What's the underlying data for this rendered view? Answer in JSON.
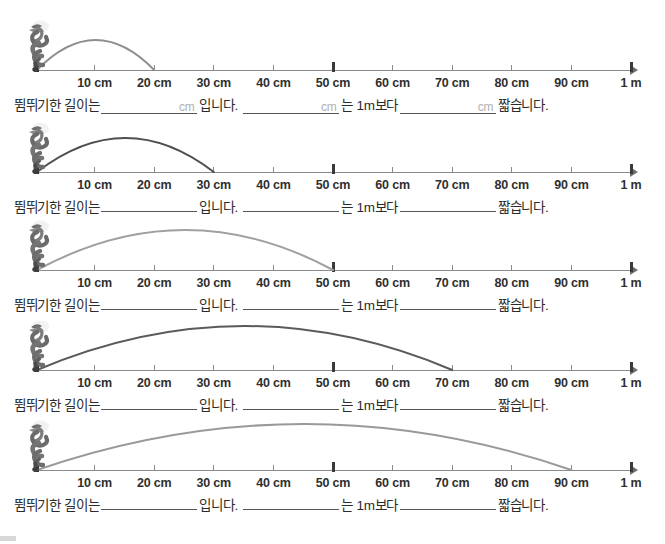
{
  "page": {
    "top_faint_text": "· · · · ·  · ·   ·",
    "axis_end_label": "1 m",
    "tick_labels": [
      "10 cm",
      "20 cm",
      "30 cm",
      "40 cm",
      "50 cm",
      "60 cm",
      "70 cm",
      "80 cm",
      "90 cm",
      "1 m"
    ],
    "tick_values_cm": [
      10,
      20,
      30,
      40,
      50,
      60,
      70,
      80,
      90,
      100
    ],
    "major_ticks_cm": [
      50,
      100
    ],
    "sentence": {
      "part1": "뜀뛰기한 길이는",
      "part2": "입니다.",
      "part3": "는 1m보다",
      "part4": "짧습니다.",
      "unit_hint": "cm"
    }
  },
  "rows": [
    {
      "index": 1,
      "landing_cm": 20,
      "landing_label": "20 cm",
      "arc_color": "#8e8e8e",
      "arc_peak_height": 30,
      "show_unit_hints": true,
      "creature": "grasshopper-icon"
    },
    {
      "index": 2,
      "landing_cm": 30,
      "landing_label": "30 cm",
      "arc_color": "#4f4f4f",
      "arc_peak_height": 34,
      "show_unit_hints": false,
      "creature": "grasshopper-icon"
    },
    {
      "index": 3,
      "landing_cm": 50,
      "landing_label": "50 cm",
      "arc_color": "#a0a0a0",
      "arc_peak_height": 40,
      "show_unit_hints": false,
      "creature": "grasshopper-icon"
    },
    {
      "index": 4,
      "landing_cm": 70,
      "landing_label": "70 cm",
      "arc_color": "#5a5a5a",
      "arc_peak_height": 44,
      "show_unit_hints": false,
      "creature": "grasshopper-icon"
    },
    {
      "index": 5,
      "landing_cm": 90,
      "landing_label": "90 cm",
      "arc_color": "#999999",
      "arc_peak_height": 46,
      "show_unit_hints": false,
      "creature": "grasshopper-icon"
    }
  ]
}
